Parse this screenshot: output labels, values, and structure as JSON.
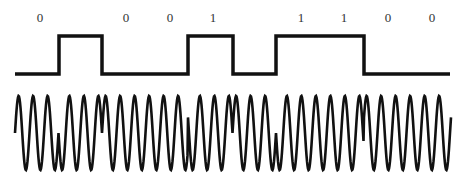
{
  "diagram": {
    "colors": {
      "stroke": "#111111",
      "label": "#333333",
      "background": "#ffffff"
    },
    "bit_labels": [
      {
        "text": "0",
        "x": 40
      },
      {
        "text": "",
        "x": 83
      },
      {
        "text": "0",
        "x": 126
      },
      {
        "text": "0",
        "x": 170
      },
      {
        "text": "1",
        "x": 213
      },
      {
        "text": "",
        "x": 257
      },
      {
        "text": "1",
        "x": 301
      },
      {
        "text": "1",
        "x": 344
      },
      {
        "text": "0",
        "x": 388
      },
      {
        "text": "0",
        "x": 432
      }
    ],
    "square_wave": {
      "low_y": 74,
      "high_y": 36,
      "start_x": 15,
      "end_x": 450,
      "segments": [
        {
          "from": 15,
          "to": 59,
          "level": 0
        },
        {
          "from": 59,
          "to": 102,
          "level": 1
        },
        {
          "from": 102,
          "to": 188,
          "level": 0
        },
        {
          "from": 188,
          "to": 233,
          "level": 1
        },
        {
          "from": 233,
          "to": 276,
          "level": 0
        },
        {
          "from": 276,
          "to": 364,
          "level": 1
        },
        {
          "from": 364,
          "to": 450,
          "level": 0
        }
      ],
      "stroke_width": 3.5
    },
    "carrier_wave": {
      "center_y": 133,
      "amplitude": 37,
      "period_px": 14.5,
      "start_x": 15,
      "end_x": 451,
      "initial_phase_deg": 180,
      "phase_flips_at_x": [
        59,
        102,
        188,
        233,
        276,
        364
      ],
      "stroke_width": 2.6
    }
  }
}
